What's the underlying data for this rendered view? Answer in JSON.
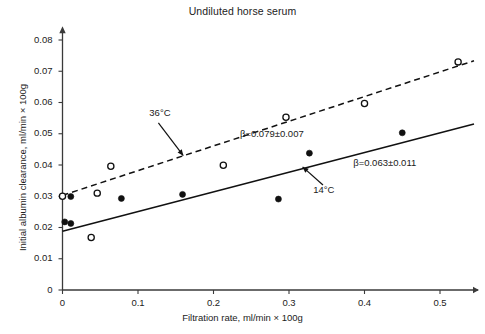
{
  "chart_data": {
    "type": "scatter",
    "title": "Undiluted horse serum",
    "xlabel": "Filtration rate, ml/min × 100g",
    "ylabel": "Initial albumin clearance, ml/min × 100g",
    "xlim": [
      0,
      0.545
    ],
    "ylim": [
      0,
      0.0825
    ],
    "xticks": [
      "0",
      "0.1",
      "0.2",
      "0.3",
      "0.4",
      "0.5"
    ],
    "xtick_values": [
      0,
      0.1,
      0.2,
      0.3,
      0.4,
      0.5
    ],
    "yticks": [
      "0",
      "0.01",
      "0.02",
      "0.03",
      "0.04",
      "0.05",
      "0.06",
      "0.07",
      "0.08"
    ],
    "ytick_values": [
      0,
      0.01,
      0.02,
      0.03,
      0.04,
      0.05,
      0.06,
      0.07,
      0.08
    ],
    "grid": false,
    "legend_position": "inline-annotations",
    "series": [
      {
        "name": "36°C",
        "marker": "open-circle",
        "line_style": "dashed",
        "slope_label": "β=0.079±0.007",
        "slope": 0.079,
        "slope_error": 0.007,
        "intercept": 0.0303,
        "points": [
          {
            "x": 0.0,
            "y": 0.03
          },
          {
            "x": 0.038,
            "y": 0.0168
          },
          {
            "x": 0.046,
            "y": 0.031
          },
          {
            "x": 0.064,
            "y": 0.0396
          },
          {
            "x": 0.213,
            "y": 0.0399
          },
          {
            "x": 0.296,
            "y": 0.0553
          },
          {
            "x": 0.4,
            "y": 0.0597
          },
          {
            "x": 0.524,
            "y": 0.073
          }
        ]
      },
      {
        "name": "14°C",
        "marker": "filled-circle",
        "line_style": "solid",
        "slope_label": "β=0.063±0.011",
        "slope": 0.063,
        "slope_error": 0.011,
        "intercept": 0.0188,
        "points": [
          {
            "x": 0.003,
            "y": 0.0218
          },
          {
            "x": 0.011,
            "y": 0.0213
          },
          {
            "x": 0.011,
            "y": 0.0299
          },
          {
            "x": 0.078,
            "y": 0.0293
          },
          {
            "x": 0.159,
            "y": 0.0306
          },
          {
            "x": 0.286,
            "y": 0.0291
          },
          {
            "x": 0.327,
            "y": 0.0438
          },
          {
            "x": 0.45,
            "y": 0.0503
          }
        ]
      }
    ],
    "annotations": [
      {
        "name": "label-36c",
        "text": "36°C",
        "x": 0.115,
        "y": 0.0565
      },
      {
        "name": "label-beta-36c",
        "text": "β=0.079±0.007",
        "x": 0.235,
        "y": 0.0497
      },
      {
        "name": "label-beta-14c",
        "text": "β=0.063±0.011",
        "x": 0.385,
        "y": 0.0404
      },
      {
        "name": "label-14c",
        "text": "14°C",
        "x": 0.332,
        "y": 0.032
      }
    ],
    "colors": {
      "axis": "#3a3a3a",
      "line": "#111111",
      "marker_fill": "#111111",
      "text": "#1a1a1a",
      "background": "#ffffff"
    }
  }
}
